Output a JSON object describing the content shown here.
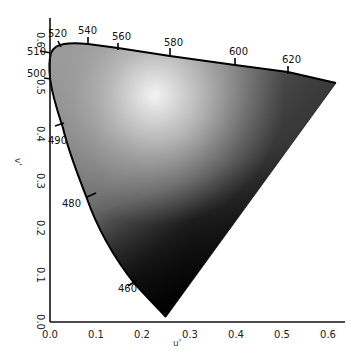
{
  "chart_data": {
    "type": "area",
    "title": "",
    "subtitle": "",
    "xlabel": "u'",
    "ylabel": "v'",
    "xlim": [
      0.0,
      0.63
    ],
    "ylim": [
      0.0,
      0.62
    ],
    "grid": false,
    "legend": null,
    "x_ticks": [
      "0.0",
      "0.1",
      "0.2",
      "0.3",
      "0.4",
      "0.5",
      "0.6"
    ],
    "y_ticks": [
      "0.0",
      "0.1",
      "0.2",
      "0.3",
      "0.4",
      "0.5",
      "0.6"
    ],
    "spectral_locus_labels": [
      {
        "nm": "460",
        "u": 0.18,
        "v": 0.08
      },
      {
        "nm": "480",
        "u": 0.08,
        "v": 0.27
      },
      {
        "nm": "490",
        "u": 0.03,
        "v": 0.41
      },
      {
        "nm": "500",
        "u": 0.0,
        "v": 0.52
      },
      {
        "nm": "510",
        "u": 0.0,
        "v": 0.57
      },
      {
        "nm": "520",
        "u": 0.02,
        "v": 0.59
      },
      {
        "nm": "540",
        "u": 0.08,
        "v": 0.59
      },
      {
        "nm": "560",
        "u": 0.15,
        "v": 0.58
      },
      {
        "nm": "580",
        "u": 0.26,
        "v": 0.56
      },
      {
        "nm": "600",
        "u": 0.4,
        "v": 0.55
      },
      {
        "nm": "620",
        "u": 0.51,
        "v": 0.53
      }
    ],
    "locus_endpoints": {
      "blue_end": {
        "u": 0.25,
        "v": 0.01
      },
      "red_end": {
        "u": 0.62,
        "v": 0.51
      }
    }
  },
  "axes": {
    "x_title": "u'",
    "y_title": "v'",
    "x_ticks": [
      {
        "label": "0.0",
        "px": 50
      },
      {
        "label": "0.1",
        "px": 96
      },
      {
        "label": "0.2",
        "px": 142
      },
      {
        "label": "0.3",
        "px": 190
      },
      {
        "label": "0.4",
        "px": 236
      },
      {
        "label": "0.5",
        "px": 282
      },
      {
        "label": "0.6",
        "px": 328
      }
    ],
    "y_ticks": [
      {
        "label": "0.0",
        "py": 322
      },
      {
        "label": "0.1",
        "py": 275
      },
      {
        "label": "0.2",
        "py": 228
      },
      {
        "label": "0.3",
        "py": 181
      },
      {
        "label": "0.4",
        "py": 134
      },
      {
        "label": "0.5",
        "py": 87
      },
      {
        "label": "0.6",
        "py": 40
      }
    ]
  },
  "wavelength_labels": [
    {
      "label": "460",
      "tx": 118,
      "ty": 292,
      "x1": 128,
      "y1": 286,
      "x2": 137,
      "y2": 280
    },
    {
      "label": "480",
      "tx": 62,
      "ty": 207,
      "x1": 87,
      "y1": 197,
      "x2": 96,
      "y2": 193
    },
    {
      "label": "490",
      "tx": 48,
      "ty": 144,
      "x1": 55,
      "y1": 126,
      "x2": 64,
      "y2": 123
    },
    {
      "label": "500",
      "tx": 27,
      "ty": 77,
      "x1": 44,
      "y1": 78,
      "x2": 51,
      "y2": 79
    },
    {
      "label": "510",
      "tx": 27,
      "ty": 55,
      "x1": 40,
      "y1": 51,
      "x2": 51,
      "y2": 53
    },
    {
      "label": "520",
      "tx": 48,
      "ty": 37,
      "x1": 58,
      "y1": 41,
      "x2": 61,
      "y2": 47
    },
    {
      "label": "540",
      "tx": 78,
      "ty": 34,
      "x1": 88,
      "y1": 37,
      "x2": 88,
      "y2": 45
    },
    {
      "label": "560",
      "tx": 112,
      "ty": 40,
      "x1": 118,
      "y1": 43,
      "x2": 118,
      "y2": 50
    },
    {
      "label": "580",
      "tx": 164,
      "ty": 46,
      "x1": 170,
      "y1": 48,
      "x2": 170,
      "y2": 57
    },
    {
      "label": "600",
      "tx": 229,
      "ty": 55,
      "x1": 235,
      "y1": 58,
      "x2": 235,
      "y2": 66
    },
    {
      "label": "620",
      "tx": 282,
      "ty": 63,
      "x1": 288,
      "y1": 66,
      "x2": 288,
      "y2": 74
    }
  ],
  "colors": {
    "background": "#ffffff",
    "axis": "#111111",
    "locus_outline": "#000000",
    "gradient_light": "#f2f2f2",
    "gradient_mid": "#9a9a9a",
    "gradient_dark": "#111111"
  }
}
